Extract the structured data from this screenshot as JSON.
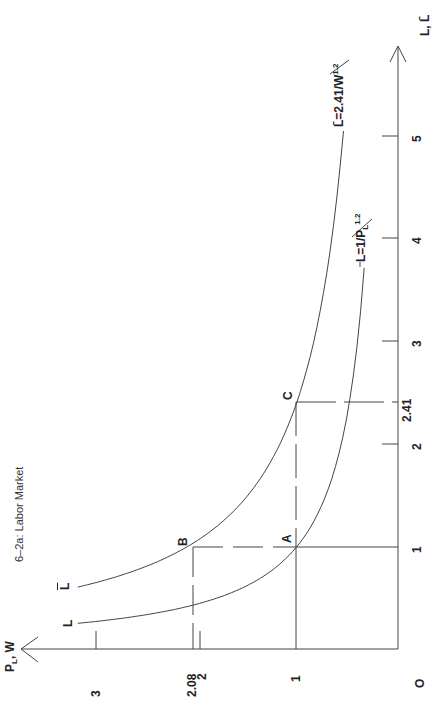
{
  "caption": "6–2a:  Labor Market",
  "chart_data": {
    "type": "line",
    "title": "6–2a: Labor Market",
    "orientation": "rotated 90° counterclockwise",
    "xlabel": "P_L, W",
    "ylabel": "L, L̄",
    "x_ticks": [
      "0",
      "1",
      "2",
      "2.08",
      "3"
    ],
    "y_ticks": [
      "1",
      "2",
      "2.41",
      "3",
      "4",
      "5"
    ],
    "xlim": [
      0,
      3.7
    ],
    "ylim": [
      0,
      5.8
    ],
    "grid": false,
    "series": [
      {
        "name": "L = 1/P_L^1.2",
        "label_text": "L",
        "formula": {
          "coef": 1,
          "exp": 1.2
        },
        "x_range": [
          0.335,
          3.17
        ]
      },
      {
        "name": "L̄ = 2.41/W^1.2",
        "label_text": "L̄",
        "formula": {
          "coef": 2.41,
          "exp": 1.2
        },
        "x_range": [
          0.54,
          3.17
        ]
      }
    ],
    "points": [
      {
        "name": "A",
        "x": 1,
        "y": 1
      },
      {
        "name": "B",
        "x": 2.08,
        "y": 1
      },
      {
        "name": "C",
        "x": 1,
        "y": 2.41
      }
    ]
  },
  "labels": {
    "origin": "O",
    "x_axis": "P",
    "x_axis_sub": "L",
    "x_axis_rest": ", W",
    "y_axis": "L, L̄",
    "curve_L_end": "L",
    "curve_Lbar_end": "L̄",
    "curve_L_eq": "L=1/P",
    "curve_L_eq_sub": "L",
    "curve_L_eq_sup": "1.2",
    "curve_Lbar_eq": "L̄=2.41/W",
    "curve_Lbar_eq_sup": "1.2",
    "tick_x_1": "1",
    "tick_x_2": "2",
    "tick_x_208": "2.08",
    "tick_x_3": "3",
    "tick_y_1": "1",
    "tick_y_2": "2",
    "tick_y_241": "2.41",
    "tick_y_3": "3",
    "tick_y_4": "4",
    "tick_y_5": "5",
    "point_A": "A",
    "point_B": "B",
    "point_C": "C"
  }
}
